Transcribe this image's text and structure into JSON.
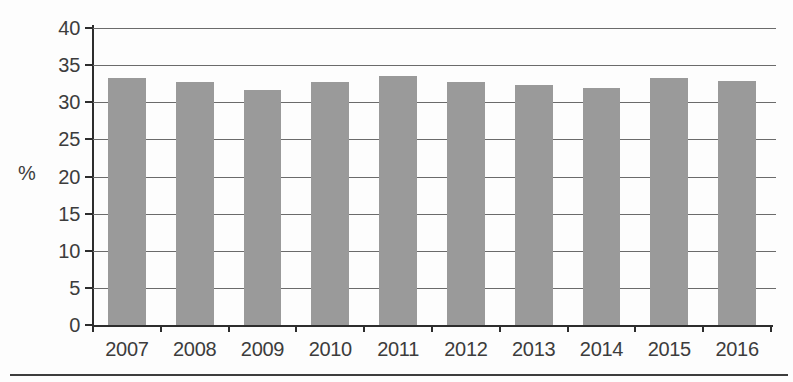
{
  "chart_data": {
    "type": "bar",
    "title": "",
    "categories": [
      "2007",
      "2008",
      "2009",
      "2010",
      "2011",
      "2012",
      "2013",
      "2014",
      "2015",
      "2016"
    ],
    "values": [
      33.3,
      32.7,
      31.7,
      32.7,
      33.5,
      32.7,
      32.3,
      31.9,
      33.3,
      32.8
    ],
    "xlabel": "",
    "ylabel": "%",
    "ylim": [
      0,
      40
    ],
    "yticks": [
      0,
      5,
      10,
      15,
      20,
      25,
      30,
      35,
      40
    ],
    "grid": true,
    "legend": false,
    "bar_color": "#9a9a9a",
    "axis_color": "#2d2d2d",
    "gridline_color": "#6b6b6b",
    "text_color": "#3c3c3c"
  }
}
